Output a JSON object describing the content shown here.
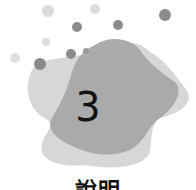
{
  "illustration": {
    "step_number": "3",
    "caption": "說明",
    "colors": {
      "background": "#ffffff",
      "blob_light": "#d3d3d3",
      "blob_dark": "#a8a8a8",
      "dot_light": "#dcdcdc",
      "dot_dark": "#8c8c8c",
      "text": "#111111"
    },
    "dots": [
      {
        "tone": "light",
        "x": 48,
        "y": 11,
        "r": 6
      },
      {
        "tone": "light",
        "x": 95,
        "y": 9,
        "r": 5
      },
      {
        "tone": "light",
        "x": 46,
        "y": 42,
        "r": 4
      },
      {
        "tone": "light",
        "x": 15,
        "y": 58,
        "r": 5
      },
      {
        "tone": "dark",
        "x": 77,
        "y": 27,
        "r": 5
      },
      {
        "tone": "dark",
        "x": 118,
        "y": 25,
        "r": 5
      },
      {
        "tone": "dark",
        "x": 165,
        "y": 15,
        "r": 6
      },
      {
        "tone": "dark",
        "x": 71,
        "y": 54,
        "r": 5
      },
      {
        "tone": "dark",
        "x": 40,
        "y": 64,
        "r": 6
      },
      {
        "tone": "dark",
        "x": 86,
        "y": 51,
        "r": 3
      }
    ]
  }
}
